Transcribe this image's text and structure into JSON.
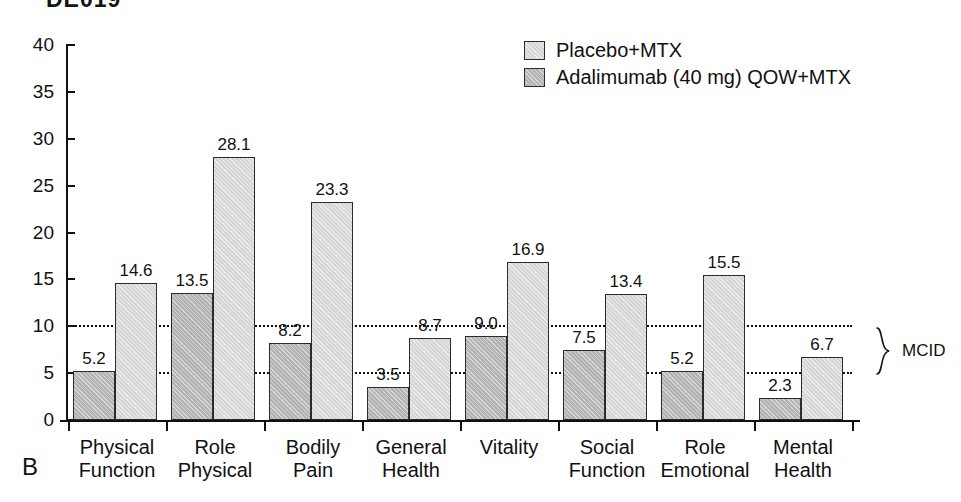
{
  "figure": {
    "panel_letter": "B",
    "clipped_title": "DE019"
  },
  "legend": {
    "position": "top-right",
    "items": [
      {
        "label": "Placebo+MTX",
        "swatch": "light-gray-square",
        "color": "#d6d6d6"
      },
      {
        "label": "Adalimumab (40 mg) QOW+MTX",
        "swatch": "dark-gray-square",
        "color": "#b3b3b3"
      }
    ]
  },
  "annotation": {
    "mcid_label": "MCID",
    "mcid_lower": 5,
    "mcid_upper": 10
  },
  "chart_data": {
    "type": "bar",
    "title": "DE019",
    "xlabel": "",
    "ylabel": "",
    "ylim": [
      0,
      40
    ],
    "yticks": [
      0,
      5,
      10,
      15,
      20,
      25,
      30,
      35,
      40
    ],
    "ytick_labels": [
      "0",
      "5",
      "10",
      "15",
      "20",
      "25",
      "30",
      "35",
      "40"
    ],
    "grid": "horizontal dotted gridlines at 5 and 10 only",
    "gridlines": [
      5,
      10
    ],
    "legend_position": "upper right",
    "categories": [
      "Physical Function",
      "Role Physical",
      "Bodily Pain",
      "General Health",
      "Vitality",
      "Social Function",
      "Role Emotional",
      "Mental Health"
    ],
    "category_lines": [
      [
        "Physical",
        "Function"
      ],
      [
        "Role",
        "Physical"
      ],
      [
        "Bodily",
        "Pain"
      ],
      [
        "General",
        "Health"
      ],
      [
        "Vitality",
        ""
      ],
      [
        "Social",
        "Function"
      ],
      [
        "Role",
        "Emotional"
      ],
      [
        "Mental",
        "Health"
      ]
    ],
    "series": [
      {
        "name": "Placebo+MTX",
        "color": "#b3b3b3",
        "values": [
          5.2,
          13.5,
          8.2,
          3.5,
          9.0,
          7.5,
          5.2,
          2.3
        ],
        "labels": [
          "5.2",
          "13.5",
          "8.2",
          "3.5",
          "9.0",
          "7.5",
          "5.2",
          "2.3"
        ]
      },
      {
        "name": "Adalimumab (40 mg) QOW+MTX",
        "color": "#d6d6d6",
        "values": [
          14.6,
          28.1,
          23.3,
          8.7,
          16.9,
          13.4,
          15.5,
          6.7
        ],
        "labels": [
          "14.6",
          "28.1",
          "23.3",
          "8.7",
          "16.9",
          "13.4",
          "15.5",
          "6.7"
        ]
      }
    ],
    "annotations": [
      {
        "text": "MCID",
        "type": "brace",
        "y_range": [
          5,
          10
        ],
        "side": "right"
      }
    ]
  }
}
